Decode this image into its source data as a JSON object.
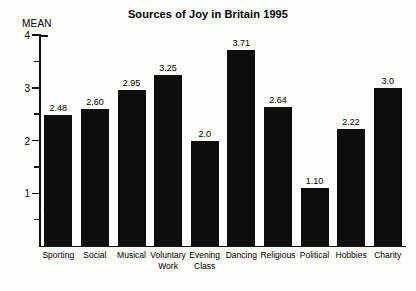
{
  "chart_data": {
    "type": "bar",
    "title": "Sources of Joy in Britain 1995",
    "xlabel": "",
    "ylabel": "MEAN",
    "ylim": [
      0,
      4
    ],
    "grid": false,
    "legend": "none",
    "y_major_ticks": [
      "4",
      "3",
      "2",
      "1"
    ],
    "y_major_tick_values": [
      4,
      3,
      2,
      1
    ],
    "y_minor_tick_values": [
      3.5,
      2.5,
      1.5,
      0.5
    ],
    "categories": [
      "Sporting",
      "Social",
      "Musical",
      "Voluntary\nWork",
      "Evening\nClass",
      "Dancing",
      "Religious",
      "Political",
      "Hobbies",
      "Charity"
    ],
    "values": [
      2.48,
      2.6,
      2.95,
      3.25,
      2.0,
      3.71,
      2.64,
      1.1,
      2.22,
      3.0
    ],
    "value_labels": [
      "2.48",
      "2.60",
      "2.95",
      "3.25",
      "2.0",
      "3.71",
      "2.64",
      "1.10",
      "2.22",
      "3.0"
    ],
    "bar_color": "#0d0d0d",
    "background_color": "#fdfdfc",
    "axis_color": "#111111"
  }
}
